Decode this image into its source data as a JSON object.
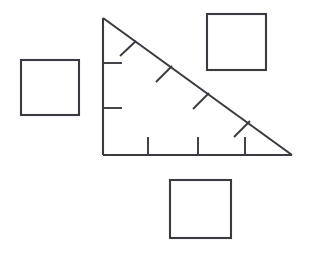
{
  "canvas": {
    "width": 309,
    "height": 259,
    "background_color": "#ffffff",
    "stroke_color": "#3a3a42",
    "stroke_width": 2.1,
    "tick_stroke_width": 1.9
  },
  "triangle": {
    "name": "right-triangle",
    "vertices": {
      "apex": {
        "x": 103,
        "y": 18
      },
      "right_angle": {
        "x": 103,
        "y": 155
      },
      "right_vertex": {
        "x": 292,
        "y": 155
      }
    },
    "edges": [
      {
        "name": "vertical-leg",
        "from": {
          "x": 103,
          "y": 18
        },
        "to": {
          "x": 103,
          "y": 155
        }
      },
      {
        "name": "horizontal-leg",
        "from": {
          "x": 103,
          "y": 155
        },
        "to": {
          "x": 292,
          "y": 155
        }
      },
      {
        "name": "hypotenuse",
        "from": {
          "x": 103,
          "y": 18
        },
        "to": {
          "x": 292,
          "y": 155
        }
      }
    ],
    "ticks": {
      "vertical_leg": [
        {
          "name": "vertical-leg-tick-1",
          "x1": 103,
          "y1": 63,
          "x2": 122,
          "y2": 63
        },
        {
          "name": "vertical-leg-tick-2",
          "x1": 103,
          "y1": 108,
          "x2": 122,
          "y2": 108
        }
      ],
      "horizontal_leg": [
        {
          "name": "horizontal-leg-tick-1",
          "x1": 148,
          "y1": 155,
          "x2": 148,
          "y2": 137
        },
        {
          "name": "horizontal-leg-tick-2",
          "x1": 198,
          "y1": 155,
          "x2": 198,
          "y2": 137
        },
        {
          "name": "horizontal-leg-tick-3",
          "x1": 245,
          "y1": 155,
          "x2": 245,
          "y2": 137
        }
      ],
      "hypotenuse": [
        {
          "name": "hypotenuse-tick-1",
          "x1": 120,
          "y1": 56,
          "x2": 136,
          "y2": 41
        },
        {
          "name": "hypotenuse-tick-2",
          "x1": 156,
          "y1": 82,
          "x2": 172,
          "y2": 66
        },
        {
          "name": "hypotenuse-tick-3",
          "x1": 193,
          "y1": 109,
          "x2": 209,
          "y2": 93
        },
        {
          "name": "hypotenuse-tick-4",
          "x1": 234,
          "y1": 137,
          "x2": 250,
          "y2": 121
        }
      ]
    }
  },
  "squares": [
    {
      "name": "square-left",
      "position": "left",
      "x": 21,
      "y": 60,
      "width": 58,
      "height": 55
    },
    {
      "name": "square-top-right",
      "position": "top-right",
      "x": 207,
      "y": 14,
      "width": 59,
      "height": 56
    },
    {
      "name": "square-bottom",
      "position": "bottom-center",
      "x": 170,
      "y": 180,
      "width": 61,
      "height": 58
    }
  ]
}
